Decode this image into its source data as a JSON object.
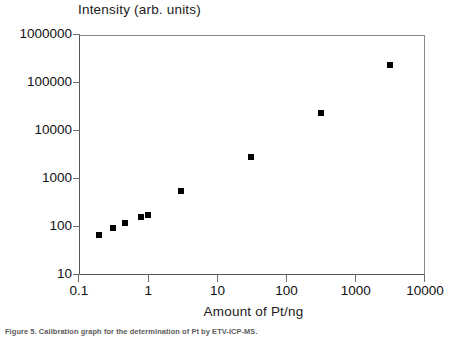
{
  "chart_data": {
    "type": "scatter",
    "title": "Intensity (arb. units)",
    "xlabel": "Amount of Pt/ng",
    "ylabel": "Intensity (arb. units)",
    "xscale": "log",
    "yscale": "log",
    "xlim": [
      0.1,
      10000
    ],
    "ylim": [
      10,
      1000000
    ],
    "grid": false,
    "legend": false,
    "xticklabels": [
      "0.1",
      "1",
      "10",
      "100",
      "1000",
      "10000"
    ],
    "xtickvalues": [
      0.1,
      1,
      10,
      100,
      1000,
      10000
    ],
    "yticklabels": [
      "10",
      "100",
      "1000",
      "10000",
      "100000",
      "1000000"
    ],
    "ytickvalues": [
      10,
      100,
      1000,
      10000,
      100000,
      1000000
    ],
    "marker": "square",
    "marker_color": "#000000",
    "series": [
      {
        "name": "Pt calibration",
        "points": [
          {
            "x": 0.19,
            "y": 70
          },
          {
            "x": 0.3,
            "y": 100
          },
          {
            "x": 0.45,
            "y": 130
          },
          {
            "x": 0.75,
            "y": 170
          },
          {
            "x": 0.95,
            "y": 190
          },
          {
            "x": 2.9,
            "y": 600
          },
          {
            "x": 30,
            "y": 3000
          },
          {
            "x": 300,
            "y": 25000
          },
          {
            "x": 3000,
            "y": 250000
          }
        ]
      }
    ]
  },
  "caption": "Figure 5. Calibration graph for the determination of Pt by ETV-ICP-MS."
}
